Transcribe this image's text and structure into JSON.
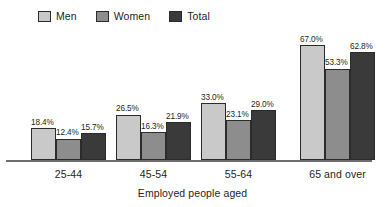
{
  "legend": {
    "items": [
      {
        "label": "Men",
        "color": "#c9c9c9"
      },
      {
        "label": "Women",
        "color": "#8d8d8d"
      },
      {
        "label": "Total",
        "color": "#3a3a3a"
      }
    ]
  },
  "axis": {
    "xlabel": "Employed people aged"
  },
  "chart_data": {
    "type": "bar",
    "title": "",
    "subtitle": "",
    "xlabel": "Employed people aged",
    "ylabel": "",
    "ylim": [
      0,
      70
    ],
    "grid": false,
    "legend_position": "top-left",
    "value_suffix": "%",
    "categories": [
      "25-44",
      "45-54",
      "55-64",
      "65 and over"
    ],
    "series": [
      {
        "name": "Men",
        "color": "#c9c9c9",
        "values": [
          18.4,
          26.5,
          33.0,
          67.0
        ],
        "labels": [
          "18.4%",
          "26.5%",
          "33.0%",
          "67.0%"
        ]
      },
      {
        "name": "Women",
        "color": "#8d8d8d",
        "values": [
          12.4,
          16.3,
          23.1,
          53.3
        ],
        "labels": [
          "12.4%",
          "16.3%",
          "23.1%",
          "53.3%"
        ]
      },
      {
        "name": "Total",
        "color": "#3a3a3a",
        "values": [
          15.7,
          21.9,
          29.0,
          62.8
        ],
        "labels": [
          "15.7%",
          "21.9%",
          "29.0%",
          "62.8%"
        ]
      }
    ]
  }
}
